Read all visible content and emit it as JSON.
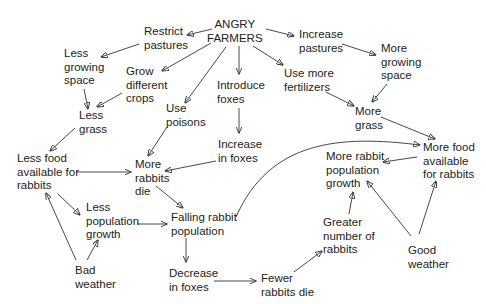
{
  "diagram": {
    "title": "ANGRY FARMERS",
    "nodes": [
      {
        "id": "angry_farmers",
        "label": "ANGRY\nFARMERS"
      },
      {
        "id": "restrict_pastures",
        "label": "Restrict\npastures"
      },
      {
        "id": "increase_pastures",
        "label": "Increase\npastures"
      },
      {
        "id": "less_growing_space",
        "label": "Less\ngrowing\nspace"
      },
      {
        "id": "grow_different_crops",
        "label": "Grow\ndifferent\ncrops"
      },
      {
        "id": "introduce_foxes",
        "label": "Introduce\nfoxes"
      },
      {
        "id": "use_more_fertilizers",
        "label": "Use more\nfertilizers"
      },
      {
        "id": "more_growing_space",
        "label": "More\ngrowing\nspace"
      },
      {
        "id": "use_poisons",
        "label": "Use\npoisons"
      },
      {
        "id": "less_grass",
        "label": "Less\ngrass"
      },
      {
        "id": "more_grass",
        "label": "More\ngrass"
      },
      {
        "id": "increase_in_foxes",
        "label": "Increase\nin foxes"
      },
      {
        "id": "less_food",
        "label": "Less food\navailable for\nrabbits"
      },
      {
        "id": "more_rabbits_die",
        "label": "More\nrabbits\ndie"
      },
      {
        "id": "more_rabbit_growth",
        "label": "More rabbit\npopulation\ngrowth"
      },
      {
        "id": "more_food",
        "label": "More food\navailable\nfor rabbits"
      },
      {
        "id": "less_population_growth",
        "label": "Less\npopulation\ngrowth"
      },
      {
        "id": "falling_rabbit_population",
        "label": "Falling rabbit\npopulation"
      },
      {
        "id": "greater_number_rabbits",
        "label": "Greater\nnumber of\nrabbits"
      },
      {
        "id": "bad_weather",
        "label": "Bad\nweather"
      },
      {
        "id": "good_weather",
        "label": "Good\nweather"
      },
      {
        "id": "decrease_in_foxes",
        "label": "Decrease\nin foxes"
      },
      {
        "id": "fewer_rabbits_die",
        "label": "Fewer\nrabbits die"
      }
    ],
    "edges": [
      {
        "from": "angry_farmers",
        "to": "restrict_pastures"
      },
      {
        "from": "angry_farmers",
        "to": "increase_pastures"
      },
      {
        "from": "angry_farmers",
        "to": "grow_different_crops"
      },
      {
        "from": "angry_farmers",
        "to": "use_poisons"
      },
      {
        "from": "angry_farmers",
        "to": "introduce_foxes"
      },
      {
        "from": "angry_farmers",
        "to": "use_more_fertilizers"
      },
      {
        "from": "restrict_pastures",
        "to": "less_growing_space"
      },
      {
        "from": "less_growing_space",
        "to": "less_grass"
      },
      {
        "from": "grow_different_crops",
        "to": "less_grass"
      },
      {
        "from": "less_grass",
        "to": "less_food"
      },
      {
        "from": "use_poisons",
        "to": "more_rabbits_die"
      },
      {
        "from": "introduce_foxes",
        "to": "increase_in_foxes"
      },
      {
        "from": "increase_in_foxes",
        "to": "more_rabbits_die"
      },
      {
        "from": "increase_pastures",
        "to": "more_growing_space"
      },
      {
        "from": "more_growing_space",
        "to": "more_grass"
      },
      {
        "from": "use_more_fertilizers",
        "to": "more_grass"
      },
      {
        "from": "more_grass",
        "to": "more_food"
      },
      {
        "from": "more_food",
        "to": "more_rabbit_growth"
      },
      {
        "from": "less_food",
        "to": "more_rabbits_die"
      },
      {
        "from": "less_food",
        "to": "less_population_growth"
      },
      {
        "from": "more_rabbits_die",
        "to": "falling_rabbit_population"
      },
      {
        "from": "less_population_growth",
        "to": "falling_rabbit_population"
      },
      {
        "from": "bad_weather",
        "to": "less_food"
      },
      {
        "from": "bad_weather",
        "to": "less_population_growth"
      },
      {
        "from": "falling_rabbit_population",
        "to": "decrease_in_foxes"
      },
      {
        "from": "falling_rabbit_population",
        "to": "more_food"
      },
      {
        "from": "decrease_in_foxes",
        "to": "fewer_rabbits_die"
      },
      {
        "from": "fewer_rabbits_die",
        "to": "greater_number_rabbits"
      },
      {
        "from": "greater_number_rabbits",
        "to": "more_rabbit_growth"
      },
      {
        "from": "good_weather",
        "to": "more_rabbit_growth"
      },
      {
        "from": "good_weather",
        "to": "more_food"
      }
    ]
  }
}
